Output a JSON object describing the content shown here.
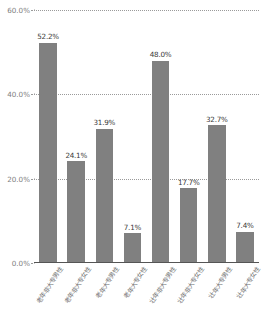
{
  "chart_data": {
    "type": "bar",
    "title": "",
    "subtitle": "",
    "xlabel": "",
    "ylabel": "",
    "ylim": [
      0,
      60
    ],
    "yticks": [
      "0.0%",
      "20.0%",
      "40.0%",
      "60.0%"
    ],
    "ytick_values": [
      0,
      20,
      40,
      60
    ],
    "grid": true,
    "legend": false,
    "bar_color": "#808080",
    "grid_color": "#9a9a9a",
    "axis_color": "#555555",
    "label_color": "#6f6f6f",
    "categories": [
      "老年非大专男性",
      "老年非大专女性",
      "老年大专男性",
      "老年大专女性",
      "壮年非大专男性",
      "壮年非大专女性",
      "壮年大专男性",
      "壮年大专女性"
    ],
    "values": [
      52.2,
      24.1,
      31.9,
      7.1,
      48.0,
      17.7,
      32.7,
      7.4
    ],
    "value_labels": [
      "52.2%",
      "24.1%",
      "31.9%",
      "7.1%",
      "48.0%",
      "17.7%",
      "32.7%",
      "7.4%"
    ]
  }
}
